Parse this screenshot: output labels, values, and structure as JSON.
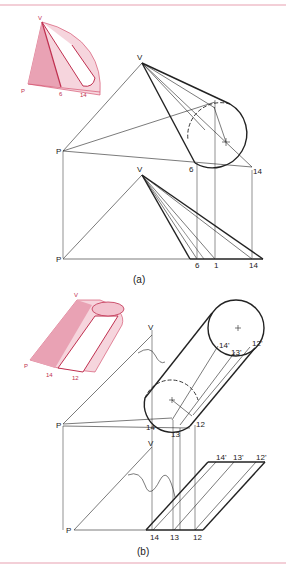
{
  "figure": {
    "rule_color": "#e8a0b0",
    "line_color": "#222222",
    "accent_color": "#d0405f",
    "part_a": {
      "caption": "(a)",
      "inset_labels": {
        "v": "V",
        "p": "P",
        "n6": "6",
        "n14": "14"
      },
      "top_view_labels": {
        "v": "V",
        "p": "P",
        "n6": "6",
        "n14": "14"
      },
      "front_view_labels": {
        "v": "V",
        "p": "P",
        "n6": "6",
        "n1": "1",
        "n14": "14"
      }
    },
    "part_b": {
      "caption": "(b)",
      "inset_labels": {
        "v": "V",
        "p": "P",
        "n14": "14",
        "n12": "12"
      },
      "top_view_labels": {
        "v": "V",
        "p": "P",
        "n14": "14",
        "n13": "13",
        "n12": "12",
        "n14p": "14'",
        "n13p": "13'",
        "n12p": "12'"
      },
      "front_view_labels": {
        "v": "V",
        "p": "P",
        "n14": "14",
        "n13": "13",
        "n12": "12",
        "n14p": "14'",
        "n13p": "13'",
        "n12p": "12'"
      }
    }
  }
}
